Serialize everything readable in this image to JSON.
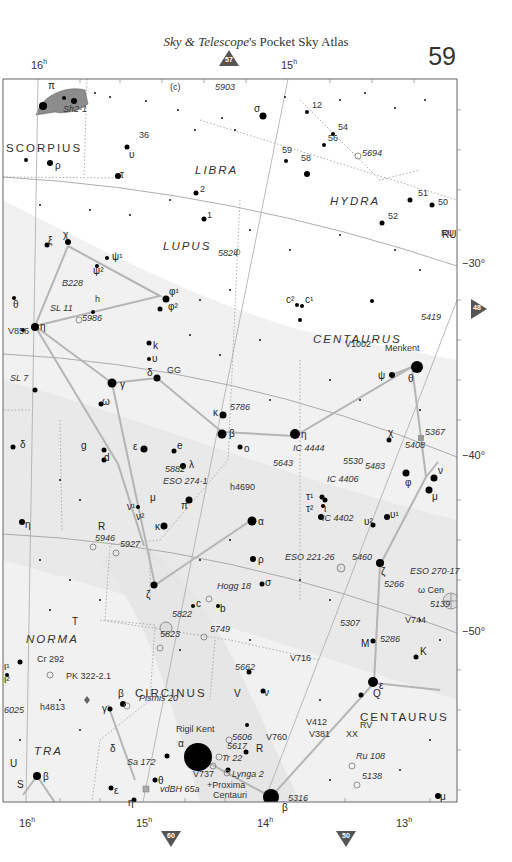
{
  "header": {
    "title_italic": "Sky & Telescope",
    "title_rest": "'s Pocket Sky Atlas",
    "page_number": "59"
  },
  "navigation": {
    "top": "57",
    "right": "48",
    "bottom_left": "60",
    "bottom_right": "50"
  },
  "axes": {
    "ra_top": [
      {
        "label": "16",
        "unit": "h",
        "x": 38
      },
      {
        "label": "15",
        "unit": "h",
        "x": 288
      }
    ],
    "ra_bottom": [
      {
        "label": "16",
        "unit": "h",
        "x": 26
      },
      {
        "label": "15",
        "unit": "h",
        "x": 143
      },
      {
        "label": "14",
        "unit": "h",
        "x": 264
      },
      {
        "label": "13",
        "unit": "h",
        "x": 403
      }
    ],
    "dec_right": [
      {
        "label": "−30°",
        "y": 266
      },
      {
        "label": "−40°",
        "y": 457
      },
      {
        "label": "−50°",
        "y": 633
      }
    ]
  },
  "constellations": [
    {
      "name": "SCORPIUS",
      "x": 6,
      "y": 142
    },
    {
      "name": "LIBRA",
      "x": 195,
      "y": 164
    },
    {
      "name": "HYDRA",
      "x": 330,
      "y": 195
    },
    {
      "name": "LUPUS",
      "x": 163,
      "y": 240
    },
    {
      "name": "CENTAURUS",
      "x": 313,
      "y": 333
    },
    {
      "name": "NORMA",
      "x": 26,
      "y": 633
    },
    {
      "name": "CIRCINUS",
      "x": 135,
      "y": 687
    },
    {
      "name": "TRA",
      "x": 34,
      "y": 745
    },
    {
      "name": "CENTAURUS",
      "x": 360,
      "y": 711
    }
  ],
  "labels": [
    {
      "t": "Sh2-1",
      "x": 63,
      "y": 112,
      "it": true
    },
    {
      "t": "(c)",
      "x": 170,
      "y": 90
    },
    {
      "t": "5903",
      "x": 215,
      "y": 90,
      "it": true
    },
    {
      "t": "36",
      "x": 139,
      "y": 138
    },
    {
      "t": "12",
      "x": 312,
      "y": 108
    },
    {
      "t": "54",
      "x": 338,
      "y": 130
    },
    {
      "t": "56",
      "x": 328,
      "y": 141
    },
    {
      "t": "59",
      "x": 282,
      "y": 153
    },
    {
      "t": "58",
      "x": 301,
      "y": 161
    },
    {
      "t": "5694",
      "x": 362,
      "y": 156,
      "it": true
    },
    {
      "t": "2",
      "x": 200,
      "y": 192
    },
    {
      "t": "1",
      "x": 207,
      "y": 218
    },
    {
      "t": "51",
      "x": 418,
      "y": 196
    },
    {
      "t": "50",
      "x": 438,
      "y": 205
    },
    {
      "t": "52",
      "x": 388,
      "y": 219
    },
    {
      "t": "RU",
      "x": 441,
      "y": 236
    },
    {
      "t": "5824",
      "x": 218,
      "y": 256,
      "it": true
    },
    {
      "t": "B228",
      "x": 62,
      "y": 286,
      "it": true
    },
    {
      "t": "h",
      "x": 95,
      "y": 302
    },
    {
      "t": "SL 11",
      "x": 50,
      "y": 311,
      "it": true
    },
    {
      "t": "5986",
      "x": 82,
      "y": 321,
      "it": true
    },
    {
      "t": "V856",
      "x": 8,
      "y": 334
    },
    {
      "t": "5419",
      "x": 421,
      "y": 320,
      "it": true
    },
    {
      "t": "V1002",
      "x": 345,
      "y": 347
    },
    {
      "t": "Menkent",
      "x": 385,
      "y": 351
    },
    {
      "t": "GG",
      "x": 167,
      "y": 373
    },
    {
      "t": "SL 7",
      "x": 10,
      "y": 381,
      "it": true
    },
    {
      "t": "5786",
      "x": 230,
      "y": 410,
      "it": true
    },
    {
      "t": "5367",
      "x": 425,
      "y": 435,
      "it": true
    },
    {
      "t": "IC 4444",
      "x": 293,
      "y": 451,
      "it": true
    },
    {
      "t": "5408",
      "x": 405,
      "y": 448,
      "it": true
    },
    {
      "t": "5643",
      "x": 273,
      "y": 466,
      "it": true
    },
    {
      "t": "5530",
      "x": 343,
      "y": 464,
      "it": true
    },
    {
      "t": "5483",
      "x": 365,
      "y": 469,
      "it": true
    },
    {
      "t": "5882",
      "x": 165,
      "y": 472,
      "it": true
    },
    {
      "t": "ESO 274-1",
      "x": 163,
      "y": 484,
      "it": true
    },
    {
      "t": "IC 4406",
      "x": 327,
      "y": 482,
      "it": true
    },
    {
      "t": "h4690",
      "x": 230,
      "y": 490
    },
    {
      "t": "IC 4402",
      "x": 322,
      "y": 521,
      "it": true
    },
    {
      "t": "5946",
      "x": 95,
      "y": 541,
      "it": true
    },
    {
      "t": "5927",
      "x": 120,
      "y": 547,
      "it": true
    },
    {
      "t": "ESO 221-26",
      "x": 285,
      "y": 560,
      "it": true
    },
    {
      "t": "5460",
      "x": 352,
      "y": 560,
      "it": true
    },
    {
      "t": "ESO 270-17",
      "x": 410,
      "y": 574,
      "it": true
    },
    {
      "t": "5266",
      "x": 384,
      "y": 587,
      "it": true
    },
    {
      "t": "ω Cen",
      "x": 418,
      "y": 593
    },
    {
      "t": "5139",
      "x": 430,
      "y": 607,
      "it": true
    },
    {
      "t": "Hogg 18",
      "x": 217,
      "y": 589,
      "it": true
    },
    {
      "t": "5822",
      "x": 172,
      "y": 617,
      "it": true
    },
    {
      "t": "5749",
      "x": 210,
      "y": 632,
      "it": true
    },
    {
      "t": "5823",
      "x": 160,
      "y": 637,
      "it": true
    },
    {
      "t": "V744",
      "x": 405,
      "y": 623
    },
    {
      "t": "5307",
      "x": 340,
      "y": 626,
      "it": true
    },
    {
      "t": "5286",
      "x": 380,
      "y": 642,
      "it": true
    },
    {
      "t": "Cr 292",
      "x": 37,
      "y": 662
    },
    {
      "t": "5662",
      "x": 235,
      "y": 670,
      "it": true
    },
    {
      "t": "PK 322-2.1",
      "x": 66,
      "y": 679
    },
    {
      "t": "V716",
      "x": 290,
      "y": 661
    },
    {
      "t": "Pismis 20",
      "x": 139,
      "y": 701,
      "it": true
    },
    {
      "t": "6025",
      "x": 4,
      "y": 713,
      "it": true
    },
    {
      "t": "h4813",
      "x": 40,
      "y": 710
    },
    {
      "t": "V412",
      "x": 306,
      "y": 725
    },
    {
      "t": "RV",
      "x": 360,
      "y": 728
    },
    {
      "t": "V381",
      "x": 309,
      "y": 737
    },
    {
      "t": "XX",
      "x": 346,
      "y": 737
    },
    {
      "t": "Rigil Kent",
      "x": 176,
      "y": 732
    },
    {
      "t": "5606",
      "x": 232,
      "y": 740,
      "it": true
    },
    {
      "t": "V760",
      "x": 266,
      "y": 740
    },
    {
      "t": "5617",
      "x": 227,
      "y": 749,
      "it": true
    },
    {
      "t": "Tr 22",
      "x": 222,
      "y": 761,
      "it": true
    },
    {
      "t": "Ru 108",
      "x": 356,
      "y": 759,
      "it": true
    },
    {
      "t": "Sa 172",
      "x": 127,
      "y": 765,
      "it": true
    },
    {
      "t": "V737",
      "x": 193,
      "y": 777
    },
    {
      "t": "Lynga 2",
      "x": 232,
      "y": 777,
      "it": true
    },
    {
      "t": "5138",
      "x": 362,
      "y": 779,
      "it": true
    },
    {
      "t": "vdBH 65a",
      "x": 160,
      "y": 792,
      "it": true
    },
    {
      "t": "+Proxima",
      "x": 207,
      "y": 788
    },
    {
      "t": "Centauri",
      "x": 213,
      "y": 798
    },
    {
      "t": "5316",
      "x": 288,
      "y": 801,
      "it": true
    }
  ]
}
